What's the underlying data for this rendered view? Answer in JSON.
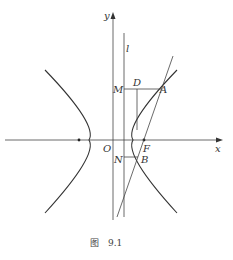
{
  "figure": {
    "caption_prefix": "图",
    "caption_number": "9.1"
  },
  "labels": {
    "y_axis": "y",
    "x_axis": "x",
    "line_l": "l",
    "origin": "O",
    "focus": "F",
    "point_a": "A",
    "point_b": "B",
    "point_d": "D",
    "point_m": "M",
    "point_n": "N"
  },
  "colors": {
    "stroke": "#333333",
    "background": "#ffffff"
  }
}
